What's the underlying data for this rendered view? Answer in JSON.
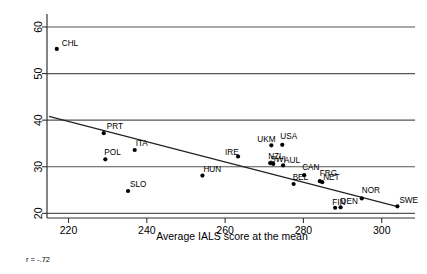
{
  "chart_data": {
    "type": "scatter",
    "title": "",
    "xlabel": "Average IALS score at the mean",
    "ylabel": "",
    "xlim": [
      214.5,
      308.5
    ],
    "ylim": [
      19.0,
      61.5
    ],
    "xticks": [
      220,
      240,
      260,
      280,
      300
    ],
    "yticks": [
      20,
      30,
      40,
      50,
      60
    ],
    "grid": "horizontal",
    "legend": "none",
    "annotations": [
      {
        "name": "correlation",
        "text": "r = -.72"
      }
    ],
    "points": [
      {
        "label": "CHL",
        "x": 217.0,
        "y": 55.3,
        "label_dx": 5,
        "label_dy": -3
      },
      {
        "label": "PRT",
        "x": 229.0,
        "y": 37.2,
        "label_dx": 3,
        "label_dy": -4
      },
      {
        "label": "POL",
        "x": 229.4,
        "y": 31.6,
        "label_dx": -1,
        "label_dy": -4
      },
      {
        "label": "ITA",
        "x": 236.9,
        "y": 33.6,
        "label_dx": 1,
        "label_dy": -4
      },
      {
        "label": "SLO",
        "x": 235.2,
        "y": 24.8,
        "label_dx": 2,
        "label_dy": -4
      },
      {
        "label": "HUN",
        "x": 254.2,
        "y": 28.1,
        "label_dx": 1,
        "label_dy": -4
      },
      {
        "label": "IRE",
        "x": 263.3,
        "y": 32.2,
        "label_dx": -13,
        "label_dy": -2
      },
      {
        "label": "UKM",
        "x": 271.8,
        "y": 34.6,
        "label_dx": -14,
        "label_dy": -3
      },
      {
        "label": "USA",
        "x": 274.6,
        "y": 34.7,
        "label_dx": -2,
        "label_dy": -6
      },
      {
        "label": "NZL",
        "x": 271.5,
        "y": 30.8,
        "label_dx": -2,
        "label_dy": -4
      },
      {
        "label": "SWI",
        "x": 272.3,
        "y": 30.6,
        "label_dx": -3,
        "label_dy": -2
      },
      {
        "label": "AUL",
        "x": 274.8,
        "y": 30.3,
        "label_dx": 1,
        "label_dy": -2
      },
      {
        "label": "CAN",
        "x": 280.2,
        "y": 28.2,
        "label_dx": -2,
        "label_dy": -5
      },
      {
        "label": "BEL",
        "x": 277.5,
        "y": 26.3,
        "label_dx": -1,
        "label_dy": -4
      },
      {
        "label": "FRG",
        "x": 284.2,
        "y": 26.9,
        "label_dx": 0,
        "label_dy": -5
      },
      {
        "label": "NET",
        "x": 284.8,
        "y": 26.7,
        "label_dx": 1,
        "label_dy": -2
      },
      {
        "label": "FIN",
        "x": 288.1,
        "y": 21.2,
        "label_dx": -3,
        "label_dy": -3
      },
      {
        "label": "DEN",
        "x": 289.5,
        "y": 21.3,
        "label_dx": 0,
        "label_dy": -3
      },
      {
        "label": "NOR",
        "x": 294.9,
        "y": 23.2,
        "label_dx": 0,
        "label_dy": -5
      },
      {
        "label": "SWE",
        "x": 304.0,
        "y": 21.5,
        "label_dx": 2,
        "label_dy": -3
      }
    ],
    "trendline": {
      "x1": 215.0,
      "y1": 40.8,
      "x2": 304.3,
      "y2": 21.4
    }
  }
}
